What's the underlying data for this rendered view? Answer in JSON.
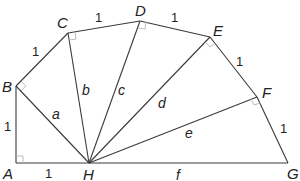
{
  "diagram": {
    "points": [
      {
        "label": "A",
        "x": 16,
        "y": 163,
        "lx": 3,
        "ly": 179
      },
      {
        "label": "B",
        "x": 16,
        "y": 86,
        "lx": 2,
        "ly": 92
      },
      {
        "label": "C",
        "x": 68,
        "y": 33,
        "lx": 57,
        "ly": 28
      },
      {
        "label": "D",
        "x": 140,
        "y": 21,
        "lx": 135,
        "ly": 16
      },
      {
        "label": "E",
        "x": 210,
        "y": 37,
        "lx": 213,
        "ly": 36
      },
      {
        "label": "F",
        "x": 257,
        "y": 97,
        "lx": 262,
        "ly": 98
      },
      {
        "label": "G",
        "x": 288,
        "y": 163,
        "lx": 287,
        "ly": 179
      },
      {
        "label": "H",
        "x": 89,
        "y": 163,
        "lx": 83,
        "ly": 180
      }
    ],
    "unit_labels": [
      {
        "text": "1",
        "x": 4,
        "y": 131
      },
      {
        "text": "1",
        "x": 45,
        "y": 178
      },
      {
        "text": "1",
        "x": 32,
        "y": 56
      },
      {
        "text": "1",
        "x": 95,
        "y": 22
      },
      {
        "text": "1",
        "x": 171,
        "y": 22
      },
      {
        "text": "1",
        "x": 236,
        "y": 66
      },
      {
        "text": "1",
        "x": 280,
        "y": 133
      }
    ],
    "hypotenuse_labels": [
      {
        "text": "a",
        "x": 52,
        "y": 119
      },
      {
        "text": "b",
        "x": 82,
        "y": 95
      },
      {
        "text": "c",
        "x": 118,
        "y": 95
      },
      {
        "text": "d",
        "x": 158,
        "y": 108
      },
      {
        "text": "e",
        "x": 185,
        "y": 138
      },
      {
        "text": "f",
        "x": 176,
        "y": 180
      }
    ]
  }
}
